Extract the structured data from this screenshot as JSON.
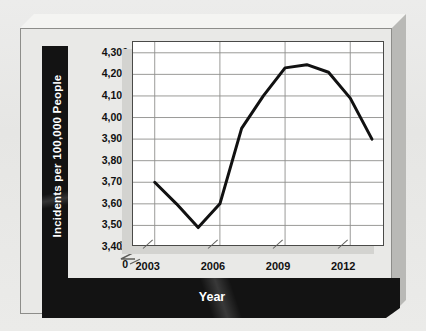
{
  "chart_data": {
    "type": "line",
    "title": "",
    "xlabel": "Year",
    "ylabel": "Incidents per 100,000 People",
    "x": [
      2003,
      2004,
      2005,
      2006,
      2007,
      2008,
      2009,
      2010,
      2011,
      2012,
      2013
    ],
    "values": [
      3700,
      3600,
      3490,
      3600,
      3950,
      4100,
      4230,
      4245,
      4210,
      4090,
      3900
    ],
    "series": [
      {
        "name": "Incidents per 100,000 People",
        "values": [
          3700,
          3600,
          3490,
          3600,
          3950,
          4100,
          4230,
          4245,
          4210,
          4090,
          3900
        ]
      }
    ],
    "ylim": [
      3400,
      4350
    ],
    "xlim": [
      2002,
      2013.6
    ],
    "y_ticks": [
      3400,
      3500,
      3600,
      3700,
      3800,
      3900,
      4000,
      4100,
      4200,
      4300
    ],
    "y_tick_labels": [
      "3,400",
      "3,500",
      "3,600",
      "3,700",
      "3,800",
      "3,900",
      "4,000",
      "4,100",
      "4,200",
      "4,300"
    ],
    "y_axis_break_label": "0",
    "x_ticks": [
      2003,
      2006,
      2009,
      2012
    ],
    "x_tick_labels": [
      "2003",
      "2006",
      "2009",
      "2012"
    ],
    "grid": true,
    "grid_axis": "both",
    "legend": false,
    "legend_position": "none",
    "line_color": "#111111",
    "line_width": 3,
    "plot_bgcolor": "#ffffff",
    "panel_color": "#e9e9e7",
    "band_color": "#131313",
    "band_text_color": "#ffffff"
  },
  "axes": {
    "y_title": "Incidents per 100,000 People",
    "x_title": "Year",
    "y_labels": [
      "4,300",
      "4,200",
      "4,100",
      "4,000",
      "3,900",
      "3,800",
      "3,700",
      "3,600",
      "3,500",
      "3,400",
      "0"
    ],
    "x_labels": [
      "2003",
      "2006",
      "2009",
      "2012"
    ]
  }
}
